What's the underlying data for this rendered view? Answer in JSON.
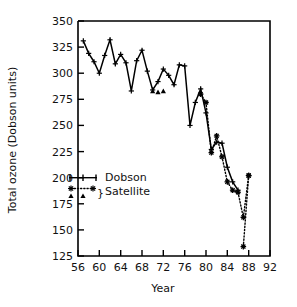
{
  "chart_data": {
    "type": "line",
    "title": "",
    "xlabel": "Year",
    "ylabel": "Total ozone (Dobson units)",
    "xlim": [
      56,
      92
    ],
    "ylim": [
      125,
      350
    ],
    "xticks": [
      56,
      60,
      64,
      68,
      72,
      76,
      80,
      84,
      88,
      92
    ],
    "yticks": [
      125,
      150,
      175,
      200,
      225,
      250,
      275,
      300,
      325,
      350
    ],
    "grid": false,
    "legend_position": "inside-left",
    "series": [
      {
        "name": "Dobson",
        "style": "solid-line-with-plus-markers",
        "marker": "plus",
        "x": [
          57,
          58,
          59,
          60,
          61,
          62,
          63,
          64,
          65,
          66,
          67,
          68,
          69,
          70,
          71,
          72,
          73,
          74,
          75,
          76,
          77,
          78,
          79,
          80,
          81,
          82,
          83,
          84,
          85,
          86
        ],
        "values": [
          331,
          319,
          311,
          300,
          317,
          332,
          309,
          318,
          310,
          283,
          312,
          322,
          302,
          284,
          292,
          304,
          298,
          289,
          308,
          307,
          250,
          272,
          285,
          262,
          227,
          234,
          233,
          210,
          196,
          188
        ]
      },
      {
        "name": "Satellite",
        "style": "dotted-line-with-asterisk-markers",
        "marker": "asterisk",
        "x": [
          79,
          80,
          81,
          82,
          83,
          84,
          85,
          86,
          87,
          88
        ],
        "values": [
          280,
          272,
          224,
          240,
          220,
          196,
          188,
          186,
          162,
          202
        ]
      },
      {
        "name": "Satellite (BUV)",
        "style": "triangle-markers",
        "marker": "triangle",
        "x": [
          70,
          71,
          72
        ],
        "values": [
          283,
          282,
          283
        ]
      },
      {
        "name": "Satellite (low)",
        "style": "dotted-line-with-asterisk-markers",
        "marker": "asterisk",
        "x": [
          87,
          88
        ],
        "values": [
          134,
          202
        ]
      }
    ]
  },
  "axes": {
    "y_label": "Total ozone (Dobson units)",
    "x_label": "Year",
    "y_tick_labels": [
      "350",
      "325",
      "300",
      "275",
      "250",
      "225",
      "200",
      "175",
      "150",
      "125"
    ],
    "x_tick_labels": [
      "56",
      "60",
      "64",
      "68",
      "72",
      "76",
      "80",
      "84",
      "88",
      "92"
    ]
  },
  "legend": {
    "entries": [
      {
        "label": "Dobson",
        "marker": "plus-line-icon"
      },
      {
        "label": "Satellite",
        "marker": "asterisk-triangle-brace-icon"
      }
    ],
    "dobson_label": "Dobson",
    "satellite_label": "Satellite",
    "brace_glyph": "}"
  },
  "colors": {
    "line": "#000000",
    "axis": "#000000",
    "background": "#ffffff",
    "text": "#111111"
  }
}
